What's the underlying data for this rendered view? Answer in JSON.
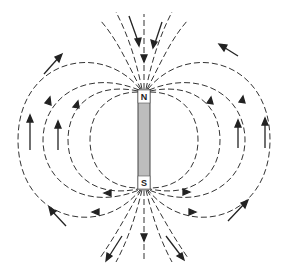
{
  "diagram": {
    "magnet": {
      "north_label": "N",
      "south_label": "S",
      "x": 138,
      "y": 90,
      "width": 12,
      "height": 99,
      "fill_color": "#bdbdbd"
    },
    "field_line_style": "dashed",
    "arrow_direction": "field lines exit N pole and re-enter at S pole (outside: N to S; arrows point upward on the sides)",
    "colors": {
      "line": "#333333",
      "background": "#ffffff"
    }
  }
}
